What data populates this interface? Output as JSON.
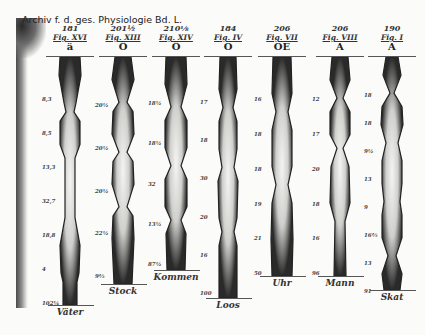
{
  "journal_header": "Archiv f. d. ges. Physiologie Bd. L.",
  "columns": [
    {
      "number": "181",
      "figure": "Fig. XVI",
      "vowel": "ä",
      "word": "Väter",
      "labels": [
        "8,3",
        "8,5",
        "13,3",
        "32,7",
        "18,8",
        "4",
        "102¼"
      ],
      "x": 48,
      "bottom": 305
    },
    {
      "number": "201½",
      "figure": "Fig. XIII",
      "vowel": "Ö",
      "word": "Stock",
      "labels": [
        "20½",
        "20½",
        "20½",
        "22½",
        "9⅔"
      ],
      "x": 101,
      "bottom": 284
    },
    {
      "number": "210⅛",
      "figure": "Fig. XIV",
      "vowel": "Ö",
      "word": "Kommen",
      "labels": [
        "18½",
        "18½",
        "32",
        "13½",
        "87½"
      ],
      "x": 154,
      "bottom": 270
    },
    {
      "number": "184",
      "figure": "Fig. IV",
      "vowel": "O",
      "word": "Loos",
      "labels": [
        "17",
        "18",
        "30",
        "20",
        "16",
        "100"
      ],
      "x": 206,
      "bottom": 298
    },
    {
      "number": "206",
      "figure": "Fig. VII",
      "vowel": "OE",
      "word": "Uhr",
      "labels": [
        "16",
        "18",
        "18",
        "19",
        "21",
        "50"
      ],
      "x": 260,
      "bottom": 276
    },
    {
      "number": "206",
      "figure": "Fig. VIII",
      "vowel": "A",
      "word": "Mann",
      "labels": [
        "12",
        "17",
        "20",
        "18",
        "16",
        "96"
      ],
      "x": 318,
      "bottom": 276
    },
    {
      "number": "190",
      "figure": "Fig. I",
      "vowel": "A",
      "word": "Skat",
      "labels": [
        "18",
        "18",
        "9½",
        "13",
        "9",
        "16⅔",
        "13",
        "91"
      ],
      "x": 370,
      "bottom": 290
    }
  ]
}
